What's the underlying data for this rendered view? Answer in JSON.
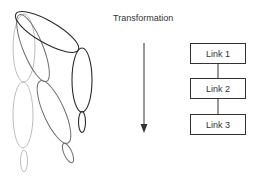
{
  "diagram": {
    "title": "Transformation",
    "arrow": {
      "direction": "down"
    },
    "links": [
      {
        "label": "Link 1"
      },
      {
        "label": "Link 2"
      },
      {
        "label": "Link 3"
      }
    ],
    "figure": {
      "description": "Articulated limb of ellipse segments shown in three poses",
      "pose_colors": [
        "#bdbdbd",
        "#6e6e6e",
        "#2a2a2a"
      ]
    }
  }
}
